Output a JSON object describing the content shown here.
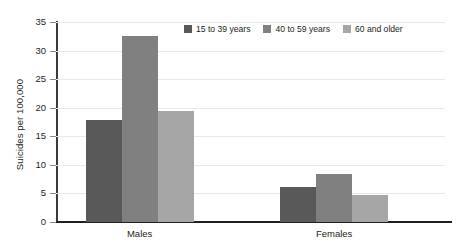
{
  "chart_data": {
    "type": "bar",
    "title": "",
    "subtitle": "",
    "xlabel": "",
    "ylabel": "Suicides per 100,000",
    "categories": [
      "Males",
      "Females"
    ],
    "series": [
      {
        "name": "15 to 39 years",
        "color": "#595959",
        "values": [
          17.8,
          6.2
        ]
      },
      {
        "name": "40 to 59 years",
        "color": "#808080",
        "values": [
          32.5,
          8.4
        ]
      },
      {
        "name": "60 and older",
        "color": "#a6a6a6",
        "values": [
          19.5,
          4.7
        ]
      }
    ],
    "ylim": [
      0,
      35
    ],
    "yticks": [
      0,
      5,
      10,
      15,
      20,
      25,
      30,
      35
    ],
    "ytick_labels": [
      "0",
      "5",
      "10",
      "15",
      "20",
      "25",
      "30",
      "35"
    ],
    "grid": true,
    "grid_axis": "y",
    "legend_position": "top-right",
    "background": "#ffffff",
    "axis_color": "#231f20",
    "gridline_color": "#e9e9e9"
  }
}
